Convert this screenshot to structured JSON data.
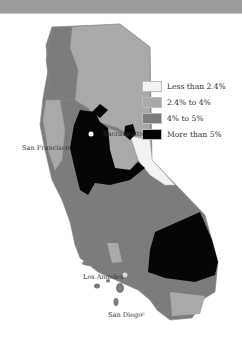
{
  "map": {
    "region": "California",
    "colors": {
      "less_than_2_4": "#f2f2f2",
      "2_4_to_4": "#a9a9a9",
      "4_to_5": "#7c7c7c",
      "more_than_5": "#050505",
      "top_band": "#9c9c9c"
    }
  },
  "legend": {
    "items": [
      {
        "label": "Less than 2.4%",
        "color": "#f2f2f2"
      },
      {
        "label": "2.4% to 4%",
        "color": "#a9a9a9"
      },
      {
        "label": "4% to 5%",
        "color": "#7c7c7c"
      },
      {
        "label": "More than 5%",
        "color": "#050505"
      }
    ]
  },
  "cities": {
    "sacramento": "Sacramento",
    "san_francisco": "San Francisco",
    "los_angeles": "Los Angeles",
    "san_diego": "San Diego"
  }
}
